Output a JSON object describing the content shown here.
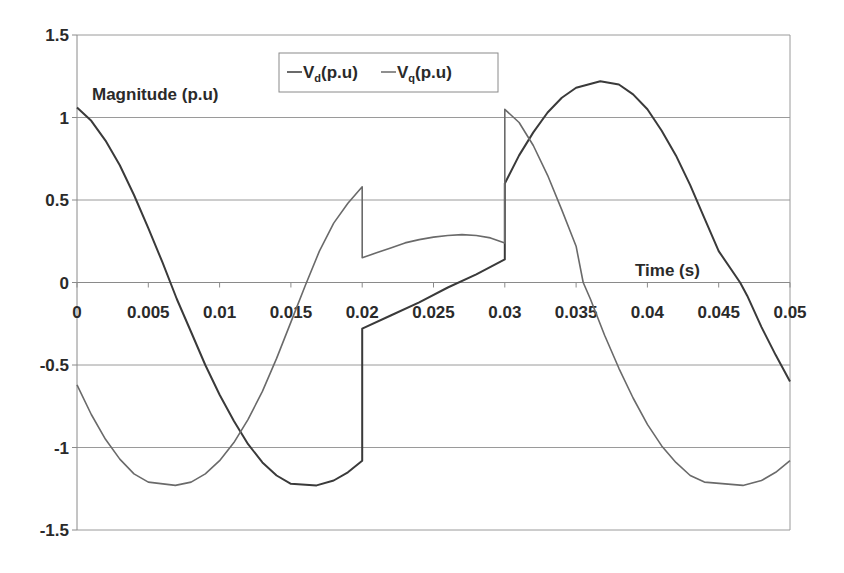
{
  "chart_data": {
    "type": "line",
    "title": "",
    "ylabel": "Magnitude (p.u)",
    "xlabel": "Time (s)",
    "xlim": [
      0,
      0.05
    ],
    "ylim": [
      -1.5,
      1.5
    ],
    "x_ticks": [
      "0",
      "0.005",
      "0.01",
      "0.015",
      "0.02",
      "0.025",
      "0.03",
      "0.035",
      "0.04",
      "0.045",
      "0.05"
    ],
    "y_ticks": [
      "1.5",
      "1",
      "0.5",
      "0",
      "-0.5",
      "-1",
      "-1.5"
    ],
    "grid": {
      "horizontal": true,
      "vertical": false
    },
    "legend": {
      "position": "top-center",
      "entries": [
        "Vd(p.u)",
        "Vq(p.u)"
      ]
    },
    "series": [
      {
        "name": "Vd(p.u)",
        "color": "#3a3a3a",
        "points": [
          [
            0,
            1.06
          ],
          [
            0.001,
            0.98
          ],
          [
            0.002,
            0.86
          ],
          [
            0.003,
            0.71
          ],
          [
            0.004,
            0.53
          ],
          [
            0.005,
            0.33
          ],
          [
            0.006,
            0.12
          ],
          [
            0.007,
            -0.1
          ],
          [
            0.008,
            -0.3
          ],
          [
            0.009,
            -0.5
          ],
          [
            0.01,
            -0.68
          ],
          [
            0.011,
            -0.84
          ],
          [
            0.012,
            -0.98
          ],
          [
            0.013,
            -1.09
          ],
          [
            0.014,
            -1.17
          ],
          [
            0.015,
            -1.22
          ],
          [
            0.0168,
            -1.23
          ],
          [
            0.018,
            -1.2
          ],
          [
            0.019,
            -1.15
          ],
          [
            0.02,
            -1.08
          ],
          [
            0.02,
            -0.28
          ],
          [
            0.022,
            -0.2
          ],
          [
            0.024,
            -0.12
          ],
          [
            0.026,
            -0.03
          ],
          [
            0.028,
            0.05
          ],
          [
            0.03,
            0.14
          ],
          [
            0.03,
            0.6
          ],
          [
            0.031,
            0.77
          ],
          [
            0.032,
            0.91
          ],
          [
            0.033,
            1.03
          ],
          [
            0.034,
            1.12
          ],
          [
            0.035,
            1.18
          ],
          [
            0.0367,
            1.22
          ],
          [
            0.038,
            1.2
          ],
          [
            0.039,
            1.14
          ],
          [
            0.04,
            1.05
          ],
          [
            0.041,
            0.92
          ],
          [
            0.042,
            0.77
          ],
          [
            0.043,
            0.59
          ],
          [
            0.044,
            0.39
          ],
          [
            0.045,
            0.19
          ],
          [
            0.0465,
            0.0
          ],
          [
            0.047,
            -0.08
          ],
          [
            0.048,
            -0.27
          ],
          [
            0.049,
            -0.44
          ],
          [
            0.05,
            -0.6
          ]
        ]
      },
      {
        "name": "Vq(p.u)",
        "color": "#6a6a6a",
        "points": [
          [
            0,
            -0.62
          ],
          [
            0.001,
            -0.8
          ],
          [
            0.002,
            -0.95
          ],
          [
            0.003,
            -1.07
          ],
          [
            0.004,
            -1.16
          ],
          [
            0.005,
            -1.21
          ],
          [
            0.0069,
            -1.23
          ],
          [
            0.008,
            -1.21
          ],
          [
            0.009,
            -1.16
          ],
          [
            0.01,
            -1.08
          ],
          [
            0.011,
            -0.97
          ],
          [
            0.012,
            -0.83
          ],
          [
            0.013,
            -0.66
          ],
          [
            0.014,
            -0.46
          ],
          [
            0.015,
            -0.24
          ],
          [
            0.016,
            -0.02
          ],
          [
            0.017,
            0.19
          ],
          [
            0.018,
            0.36
          ],
          [
            0.019,
            0.48
          ],
          [
            0.02,
            0.58
          ],
          [
            0.02,
            0.15
          ],
          [
            0.021,
            0.18
          ],
          [
            0.022,
            0.21
          ],
          [
            0.023,
            0.24
          ],
          [
            0.024,
            0.26
          ],
          [
            0.025,
            0.275
          ],
          [
            0.026,
            0.285
          ],
          [
            0.027,
            0.29
          ],
          [
            0.028,
            0.285
          ],
          [
            0.029,
            0.27
          ],
          [
            0.03,
            0.24
          ],
          [
            0.03,
            1.05
          ],
          [
            0.031,
            0.97
          ],
          [
            0.032,
            0.83
          ],
          [
            0.033,
            0.65
          ],
          [
            0.034,
            0.44
          ],
          [
            0.035,
            0.22
          ],
          [
            0.0355,
            0.0
          ],
          [
            0.036,
            -0.1
          ],
          [
            0.037,
            -0.32
          ],
          [
            0.038,
            -0.52
          ],
          [
            0.039,
            -0.7
          ],
          [
            0.04,
            -0.86
          ],
          [
            0.041,
            -0.99
          ],
          [
            0.042,
            -1.09
          ],
          [
            0.043,
            -1.17
          ],
          [
            0.044,
            -1.21
          ],
          [
            0.0467,
            -1.23
          ],
          [
            0.048,
            -1.2
          ],
          [
            0.049,
            -1.15
          ],
          [
            0.05,
            -1.08
          ]
        ]
      }
    ]
  }
}
